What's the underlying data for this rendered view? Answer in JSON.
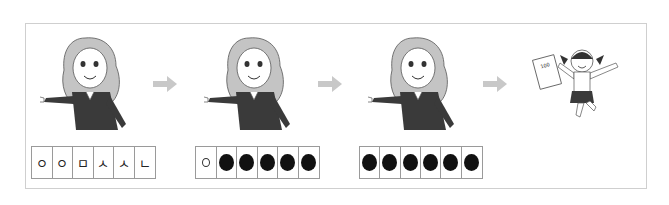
{
  "panels": [
    {
      "figure": "teacher-pointing",
      "cells": [
        {
          "type": "text",
          "value": "ㅇ"
        },
        {
          "type": "text",
          "value": "ㅇ"
        },
        {
          "type": "text",
          "value": "ㅁ"
        },
        {
          "type": "text",
          "value": "ㅅ"
        },
        {
          "type": "text",
          "value": "ㅅ"
        },
        {
          "type": "text",
          "value": "ㄴ"
        }
      ]
    },
    {
      "figure": "teacher-pointing",
      "cells": [
        {
          "type": "ring",
          "value": ""
        },
        {
          "type": "dot",
          "value": ""
        },
        {
          "type": "dot",
          "value": ""
        },
        {
          "type": "dot",
          "value": ""
        },
        {
          "type": "dot",
          "value": ""
        },
        {
          "type": "dot",
          "value": ""
        }
      ]
    },
    {
      "figure": "teacher-pointing",
      "cells": [
        {
          "type": "dot",
          "value": ""
        },
        {
          "type": "dot",
          "value": ""
        },
        {
          "type": "dot",
          "value": ""
        },
        {
          "type": "dot",
          "value": ""
        },
        {
          "type": "dot",
          "value": ""
        },
        {
          "type": "dot",
          "value": ""
        }
      ]
    },
    {
      "figure": "girl-jumping-with-test-paper",
      "test_score": "100"
    }
  ],
  "arrows": [
    "right-arrow",
    "right-arrow",
    "right-arrow"
  ],
  "colors": {
    "frame": "#cfcfcf",
    "arrow": "#c8c8c8",
    "sweater": "#3a3a3a",
    "hair": "#bdbdbd",
    "cell_border": "#9a9a9a",
    "dot": "#111111"
  }
}
